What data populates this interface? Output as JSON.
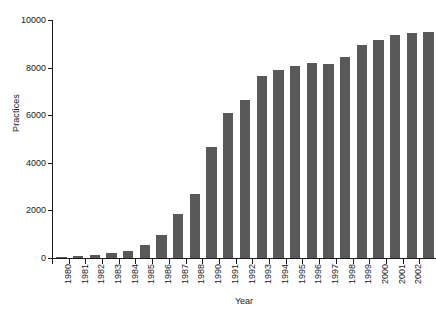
{
  "chart_data": {
    "type": "bar",
    "title": "",
    "xlabel": "Year",
    "ylabel": "Practices",
    "ylim": [
      0,
      10000
    ],
    "yticks": [
      0,
      2000,
      4000,
      6000,
      8000,
      10000
    ],
    "ytick_labels": [
      "0",
      "2000",
      "4000",
      "6000",
      "8000",
      "10000"
    ],
    "grid": false,
    "legend": "none",
    "bar_color": "#595959",
    "axis_color": "#1a1a1a",
    "background": "#ffffff",
    "categories": [
      "1980",
      "1981",
      "1982",
      "1983",
      "1984",
      "1985",
      "1986",
      "1987",
      "1988",
      "1989",
      "1990",
      "1991",
      "1992",
      "1993",
      "1994",
      "1995",
      "1996",
      "1997",
      "1998",
      "1999",
      "2000",
      "2001",
      "2002"
    ],
    "xtick_labels": [
      "1980",
      "1981",
      "1982",
      "1983",
      "1984",
      "1985",
      "1986",
      "1987",
      "1988",
      "1990",
      "1991",
      "1992",
      "1993",
      "1994",
      "1995",
      "1996",
      "1997",
      "1998",
      "1999",
      "2000",
      "2001",
      "2002"
    ],
    "values": [
      60,
      90,
      140,
      210,
      290,
      530,
      950,
      1850,
      2700,
      4650,
      6100,
      6650,
      7650,
      7900,
      8050,
      8200,
      8150,
      8450,
      8950,
      9150,
      9350,
      9450,
      9500
    ],
    "series": [
      {
        "name": "Practices",
        "values": [
          60,
          90,
          140,
          210,
          290,
          530,
          950,
          1850,
          2700,
          4650,
          6100,
          6650,
          7650,
          7900,
          8050,
          8200,
          8150,
          8450,
          8950,
          9150,
          9350,
          9450,
          9500
        ]
      }
    ]
  }
}
